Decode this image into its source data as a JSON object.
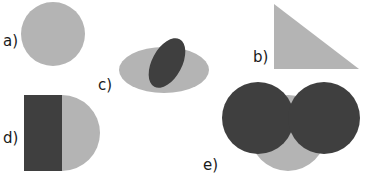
{
  "figure": {
    "canvas": {
      "width": 367,
      "height": 177,
      "background": "#ffffff"
    },
    "palette": {
      "light_gray": "#b4b4b4",
      "dark_gray": "#3f3f3f",
      "label_color": "#1a1a1a"
    },
    "groups": [
      {
        "id": "a",
        "label": "a)",
        "label_x": 3,
        "label_y": 46,
        "shapes": [
          {
            "kind": "circle",
            "fill": "light_gray",
            "cx": 53,
            "cy": 34,
            "r": 32
          }
        ]
      },
      {
        "id": "b",
        "label": "b)",
        "label_x": 253,
        "label_y": 62,
        "shapes": [
          {
            "kind": "triangle",
            "fill": "light_gray",
            "points": "274,4 274,69 359,69"
          }
        ]
      },
      {
        "id": "c",
        "label": "c)",
        "label_x": 98,
        "label_y": 90,
        "shapes": [
          {
            "kind": "ellipse",
            "fill": "light_gray",
            "cx": 164,
            "cy": 70,
            "rx": 45,
            "ry": 23,
            "rotate": 0
          },
          {
            "kind": "ellipse",
            "fill": "dark_gray",
            "cx": 167,
            "cy": 63,
            "rx": 15,
            "ry": 27,
            "rotate": 28
          }
        ]
      },
      {
        "id": "d",
        "label": "d)",
        "label_x": 3,
        "label_y": 143,
        "shapes": [
          {
            "kind": "circle",
            "fill": "light_gray",
            "cx": 62,
            "cy": 133,
            "r": 38
          },
          {
            "kind": "rect",
            "fill": "dark_gray",
            "x": 24,
            "y": 95,
            "width": 38,
            "height": 76
          }
        ]
      },
      {
        "id": "e",
        "label": "e)",
        "label_x": 203,
        "label_y": 170,
        "shapes": [
          {
            "kind": "circle",
            "fill": "light_gray",
            "cx": 288,
            "cy": 133,
            "r": 38
          },
          {
            "kind": "circle",
            "fill": "dark_gray",
            "cx": 258,
            "cy": 118,
            "r": 36
          },
          {
            "kind": "circle",
            "fill": "dark_gray",
            "cx": 324,
            "cy": 118,
            "r": 36
          }
        ]
      }
    ]
  }
}
